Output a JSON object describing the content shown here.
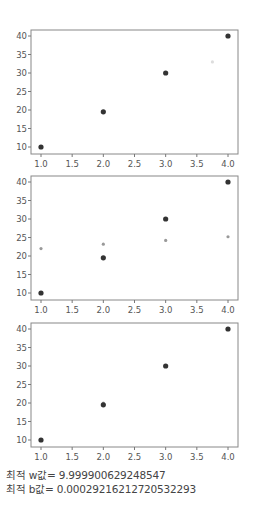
{
  "chart_data": [
    {
      "type": "scatter",
      "title": "",
      "xlabel": "",
      "ylabel": "",
      "xlim": [
        0.9,
        4.1
      ],
      "ylim": [
        9,
        41
      ],
      "xticks": [
        "1.0",
        "1.5",
        "2.0",
        "2.5",
        "3.0",
        "3.5",
        "4.0"
      ],
      "yticks": [
        "10",
        "15",
        "20",
        "25",
        "30",
        "35",
        "40"
      ],
      "grid": false,
      "series": [
        {
          "name": "data",
          "color": "#333333",
          "x": [
            1.0,
            2.0,
            3.0,
            4.0
          ],
          "y": [
            10,
            19.5,
            30,
            40
          ]
        },
        {
          "name": "faint",
          "color": "#dddddd",
          "x": [
            3.75
          ],
          "y": [
            33
          ]
        }
      ]
    },
    {
      "type": "scatter",
      "title": "",
      "xlabel": "",
      "ylabel": "",
      "xlim": [
        0.9,
        4.1
      ],
      "ylim": [
        9,
        41
      ],
      "xticks": [
        "1.0",
        "1.5",
        "2.0",
        "2.5",
        "3.0",
        "3.5",
        "4.0"
      ],
      "yticks": [
        "10",
        "15",
        "20",
        "25",
        "30",
        "35",
        "40"
      ],
      "grid": false,
      "series": [
        {
          "name": "data",
          "color": "#333333",
          "x": [
            1.0,
            2.0,
            3.0,
            4.0
          ],
          "y": [
            10,
            19.5,
            30,
            40
          ]
        },
        {
          "name": "prediction",
          "color": "#999999",
          "x": [
            1.0,
            2.0,
            3.0,
            4.0
          ],
          "y": [
            22,
            23.2,
            24.2,
            25.2
          ]
        }
      ]
    },
    {
      "type": "scatter",
      "title": "",
      "xlabel": "",
      "ylabel": "",
      "xlim": [
        0.9,
        4.1
      ],
      "ylim": [
        9,
        41
      ],
      "xticks": [
        "1.0",
        "1.5",
        "2.0",
        "2.5",
        "3.0",
        "3.5",
        "4.0"
      ],
      "yticks": [
        "10",
        "15",
        "20",
        "25",
        "30",
        "35",
        "40"
      ],
      "grid": false,
      "series": [
        {
          "name": "data",
          "color": "#333333",
          "x": [
            1.0,
            2.0,
            3.0,
            4.0
          ],
          "y": [
            10,
            19.5,
            30,
            40
          ]
        },
        {
          "name": "prediction",
          "color": "#aaaaaa",
          "x": [
            1.0,
            2.0,
            3.0,
            4.0
          ],
          "y": [
            10,
            20,
            30,
            40
          ]
        }
      ]
    }
  ],
  "results": {
    "w_line": "최적 w값= 9.999900629248547",
    "b_line": "최적 b값= 0.00029216212720532293"
  }
}
